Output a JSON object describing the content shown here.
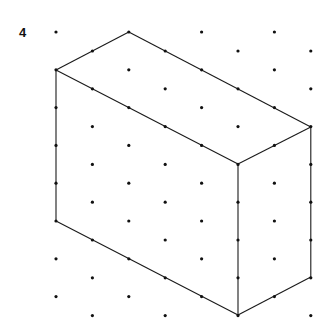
{
  "problem_number": "4",
  "colors": {
    "line": "#1a1a1a",
    "dot": "#111111",
    "background": "#ffffff"
  },
  "grid": {
    "type": "isometric-dot",
    "columns_x": [
      56,
      92.4,
      128.8,
      165.2,
      201.6,
      238,
      274.4,
      310.8
    ],
    "even_col_start_y": 32,
    "odd_col_start_y": 51,
    "row_step": 37.8,
    "rows_per_column": 8
  },
  "shape": {
    "name": "isometric rectangular prism",
    "vertices": {
      "top_back": [
        128.8,
        32
      ],
      "top_left": [
        56,
        70
      ],
      "top_right": [
        310.8,
        127
      ],
      "top_front": [
        238,
        164
      ],
      "bottom_left": [
        56,
        221
      ],
      "bottom_front": [
        238,
        315
      ],
      "bottom_right": [
        310.8,
        277
      ]
    },
    "edges": [
      [
        "top_back",
        "top_left"
      ],
      [
        "top_back",
        "top_right"
      ],
      [
        "top_left",
        "top_front"
      ],
      [
        "top_right",
        "top_front"
      ],
      [
        "top_left",
        "bottom_left"
      ],
      [
        "top_front",
        "bottom_front"
      ],
      [
        "top_right",
        "bottom_right"
      ],
      [
        "bottom_left",
        "bottom_front"
      ],
      [
        "bottom_right",
        "bottom_front"
      ]
    ]
  }
}
